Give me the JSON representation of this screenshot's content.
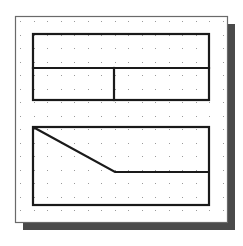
{
  "canvas": {
    "width": 243,
    "height": 246,
    "background": "#ffffff"
  },
  "panel": {
    "x": 15,
    "y": 16,
    "width": 212,
    "height": 206,
    "fill": "#ffffff",
    "border": "#6a6a6a"
  },
  "shadow": {
    "dx": 8,
    "dy": 8,
    "color": "#4a4a4a"
  },
  "grid": {
    "spacing": 13.5,
    "dot_color": "#9a9a9a",
    "origin_x": 20,
    "origin_y": 21
  },
  "line_color": "#1a1a1a",
  "line_width": 2.2,
  "top_rect": {
    "x": 33,
    "y": 34,
    "width": 176,
    "height": 66,
    "h_divider_y": 68,
    "v_divider_x": 114
  },
  "bottom_rect": {
    "x": 33,
    "y": 127,
    "width": 176,
    "height": 78
  },
  "polyline": [
    [
      33,
      127
    ],
    [
      115,
      172
    ],
    [
      209,
      172
    ]
  ]
}
